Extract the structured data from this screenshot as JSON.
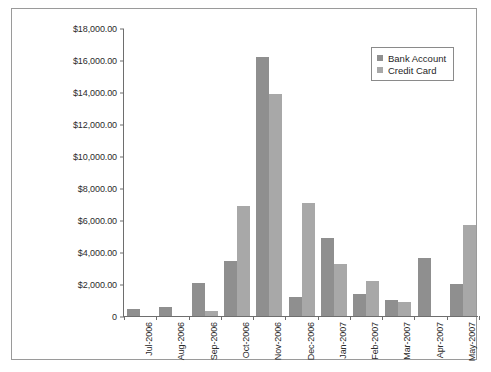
{
  "chart_data": {
    "type": "bar",
    "title": "",
    "subtitle": "",
    "xlabel": "",
    "ylabel": "",
    "ylim": [
      0,
      18000
    ],
    "grid": false,
    "legend_position": "top-right",
    "categories": [
      "Jul-2006",
      "Aug-2006",
      "Sep-2006",
      "Oct-2006",
      "Nov-2006",
      "Dec-2006",
      "Jan-2007",
      "Feb-2007",
      "Mar-2007",
      "Apr-2007",
      "May-2007"
    ],
    "ytick_labels": [
      "$18,000.00",
      "$16,000.00",
      "$14,000.00",
      "$12,000.00",
      "$10,000.00",
      "$8,000.00",
      "$6,000.00",
      "$4,000.00",
      "$2,000.00",
      "0"
    ],
    "ytick_values": [
      18000,
      16000,
      14000,
      12000,
      10000,
      8000,
      6000,
      4000,
      2000,
      0
    ],
    "series": [
      {
        "name": "Bank Account",
        "color": "#8f8f8f",
        "values": [
          450,
          580,
          2050,
          3450,
          16200,
          1200,
          4900,
          1400,
          1000,
          3600,
          2000
        ]
      },
      {
        "name": "Credit Card",
        "color": "#a8a8a8",
        "values": [
          0,
          0,
          300,
          6900,
          13850,
          7050,
          3250,
          2200,
          850,
          0,
          5700
        ]
      }
    ]
  },
  "legend": {
    "items": [
      {
        "label": "Bank Account",
        "color": "#8f8f8f"
      },
      {
        "label": "Credit Card",
        "color": "#a8a8a8"
      }
    ]
  },
  "colors": {
    "bank_account": "#8f8f8f",
    "credit_card": "#a8a8a8",
    "axis": "#6e6e6e",
    "frame": "#9a9a9a",
    "text": "#2b2b2b",
    "background": "#ffffff"
  }
}
